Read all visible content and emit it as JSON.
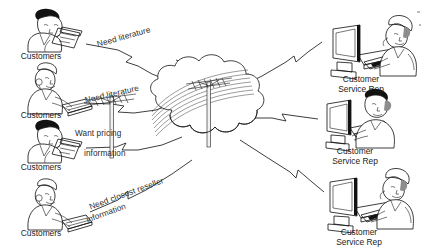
{
  "diagram": {
    "type": "network-flow",
    "cloud": {
      "name": "telephone-network-cloud",
      "contents": "utility poles with telephone wires"
    },
    "left_nodes": [
      {
        "id": "customer-1",
        "caption": "Customers",
        "figure": "man-with-telephone"
      },
      {
        "id": "customer-2",
        "caption": "Customers",
        "figure": "woman-with-headset-at-keyboard"
      },
      {
        "id": "customer-3",
        "caption": "Customers",
        "figure": "man-with-telephone"
      },
      {
        "id": "customer-4",
        "caption": "Customers",
        "figure": "woman-with-headset-at-keyboard"
      }
    ],
    "right_nodes": [
      {
        "id": "csr-1",
        "caption_line1": "Customer",
        "caption_line2": "Service Rep",
        "figure": "rep-at-computer-with-headset"
      },
      {
        "id": "csr-2",
        "caption_line1": "Customer",
        "caption_line2": "Service Rep",
        "figure": "rep-at-computer-with-headset"
      },
      {
        "id": "csr-3",
        "caption_line1": "Customer",
        "caption_line2": "Service Rep",
        "figure": "rep-at-computer-with-headset"
      }
    ],
    "edge_labels": [
      {
        "id": "edge-label-1",
        "text": "Need literature",
        "from": "customer-1",
        "to": "telephone-network-cloud"
      },
      {
        "id": "edge-label-2",
        "text": "Need literature",
        "from": "customer-2",
        "to": "telephone-network-cloud"
      },
      {
        "id": "edge-label-3-line1",
        "text": "Want pricing",
        "from": "customer-3",
        "to": "telephone-network-cloud"
      },
      {
        "id": "edge-label-3-line2",
        "text": "information",
        "from": "customer-3",
        "to": "telephone-network-cloud"
      },
      {
        "id": "edge-label-4-line1",
        "text": "Need closest reseller",
        "from": "customer-4",
        "to": "telephone-network-cloud"
      },
      {
        "id": "edge-label-4-line2",
        "text": "information",
        "from": "customer-4",
        "to": "telephone-network-cloud"
      }
    ],
    "colors": {
      "ink": "#1b1b1b",
      "background": "#ffffff",
      "wire": "#4a4a4a",
      "shadow": "#8d8d8d"
    }
  }
}
